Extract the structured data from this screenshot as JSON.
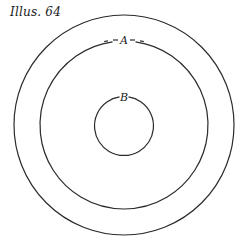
{
  "figure": {
    "caption": "Illus. 64",
    "labels": {
      "a": "A",
      "b": "B"
    },
    "circles": [
      {
        "name": "outer-circle"
      },
      {
        "name": "middle-circle",
        "label": "A"
      },
      {
        "name": "inner-circle",
        "label": "B"
      }
    ],
    "stroke_color": "#2a2a2a"
  }
}
